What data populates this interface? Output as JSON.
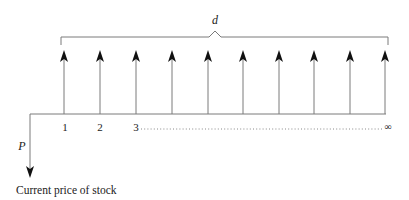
{
  "diagram": {
    "type": "cash-flow-timeline",
    "brace_label": "d",
    "present_value_label": "P",
    "caption": "Current price of stock",
    "period_labels": [
      "1",
      "2",
      "3"
    ],
    "infinity_label": "∞",
    "arrow_count": 10,
    "colors": {
      "line": "#7a7a7a",
      "arrowhead": "#111111",
      "text": "#222222"
    }
  }
}
